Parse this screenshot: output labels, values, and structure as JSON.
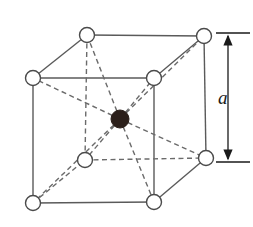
{
  "figure": {
    "background_color": "#ffffff",
    "width": 253,
    "height": 227
  },
  "style": {
    "edge_solid_color": "#5a5a5a",
    "edge_dashed_color": "#6b6b6b",
    "diagonal_dashed_color": "#6b6b6b",
    "atom_stroke_color": "#4a4a4a",
    "atom_corner_fill": "#ffffff",
    "atom_center_fill": "#2b1f1a",
    "dimension_color": "#1a1a1a",
    "edge_width": 1.4,
    "dash_pattern": "5,3.5",
    "corner_radius": 7.5,
    "center_radius": 9
  },
  "lattice": {
    "type": "bcc",
    "corner_atom_count": 8,
    "center_atom_count": 1,
    "atoms": [
      {
        "id": "front-top-left",
        "label": "corner-atom",
        "kind": "corner",
        "cx": 33,
        "cy": 78,
        "r": 7.5
      },
      {
        "id": "front-top-right",
        "label": "corner-atom",
        "kind": "corner",
        "cx": 154,
        "cy": 78,
        "r": 7.5
      },
      {
        "id": "front-bottom-left",
        "label": "corner-atom",
        "kind": "corner",
        "cx": 33,
        "cy": 203,
        "r": 7.5
      },
      {
        "id": "front-bottom-right",
        "label": "corner-atom",
        "kind": "corner",
        "cx": 154,
        "cy": 202,
        "r": 7.5
      },
      {
        "id": "back-top-left",
        "label": "corner-atom",
        "kind": "corner",
        "cx": 87,
        "cy": 35,
        "r": 7.5
      },
      {
        "id": "back-top-right",
        "label": "corner-atom",
        "kind": "corner",
        "cx": 204,
        "cy": 36,
        "r": 7.5
      },
      {
        "id": "back-bottom-left",
        "label": "corner-atom",
        "kind": "corner",
        "cx": 85,
        "cy": 160,
        "r": 7.5
      },
      {
        "id": "back-bottom-right",
        "label": "corner-atom",
        "kind": "corner",
        "cx": 206,
        "cy": 158,
        "r": 7.5
      },
      {
        "id": "body-center",
        "label": "center-atom",
        "kind": "center",
        "cx": 120,
        "cy": 119,
        "r": 9
      }
    ],
    "solid_edges": [
      {
        "id": "front-top",
        "x1": 33,
        "y1": 78,
        "x2": 154,
        "y2": 78
      },
      {
        "id": "front-bottom",
        "x1": 33,
        "y1": 203,
        "x2": 154,
        "y2": 202
      },
      {
        "id": "front-left",
        "x1": 33,
        "y1": 78,
        "x2": 33,
        "y2": 203
      },
      {
        "id": "front-right",
        "x1": 154,
        "y1": 78,
        "x2": 154,
        "y2": 202
      },
      {
        "id": "back-top",
        "x1": 87,
        "y1": 35,
        "x2": 204,
        "y2": 36
      },
      {
        "id": "back-right",
        "x1": 204,
        "y1": 36,
        "x2": 206,
        "y2": 158
      },
      {
        "id": "top-left-connector",
        "x1": 33,
        "y1": 78,
        "x2": 87,
        "y2": 35
      },
      {
        "id": "top-right-connector",
        "x1": 154,
        "y1": 78,
        "x2": 204,
        "y2": 36
      },
      {
        "id": "bottom-right-connector",
        "x1": 154,
        "y1": 202,
        "x2": 206,
        "y2": 158
      }
    ],
    "dashed_edges": [
      {
        "id": "back-left",
        "x1": 87,
        "y1": 35,
        "x2": 85,
        "y2": 160
      },
      {
        "id": "back-bottom",
        "x1": 85,
        "y1": 160,
        "x2": 206,
        "y2": 158
      },
      {
        "id": "bottom-left-connector",
        "x1": 33,
        "y1": 203,
        "x2": 85,
        "y2": 160
      }
    ],
    "body_diagonals": [
      {
        "id": "diag-to-front-top-left",
        "x1": 120,
        "y1": 119,
        "x2": 33,
        "y2": 78
      },
      {
        "id": "diag-to-front-top-right",
        "x1": 120,
        "y1": 119,
        "x2": 154,
        "y2": 78
      },
      {
        "id": "diag-to-front-bottom-left",
        "x1": 120,
        "y1": 119,
        "x2": 33,
        "y2": 203
      },
      {
        "id": "diag-to-front-bottom-right",
        "x1": 120,
        "y1": 119,
        "x2": 154,
        "y2": 202
      },
      {
        "id": "diag-to-back-top-left",
        "x1": 120,
        "y1": 119,
        "x2": 87,
        "y2": 35
      },
      {
        "id": "diag-to-back-top-right",
        "x1": 120,
        "y1": 119,
        "x2": 204,
        "y2": 36
      },
      {
        "id": "diag-to-back-bottom-left",
        "x1": 120,
        "y1": 119,
        "x2": 85,
        "y2": 160
      },
      {
        "id": "diag-to-back-bottom-right",
        "x1": 120,
        "y1": 119,
        "x2": 206,
        "y2": 158
      }
    ]
  },
  "dimension": {
    "label": "a",
    "meaning": "lattice-constant",
    "axis_x": 228,
    "top_y": 33,
    "bottom_y": 162,
    "tick_x1": 216,
    "tick_x2": 250,
    "label_x": 218,
    "label_y": 100
  }
}
